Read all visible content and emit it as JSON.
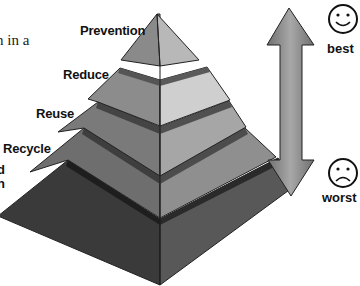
{
  "text_fragments": {
    "left_top": "n in a",
    "left_mid_1": "d",
    "left_mid_2": "n"
  },
  "pyramid": {
    "levels": [
      {
        "label": "Prevention",
        "left_color": "#8a8a8a",
        "right_color": "#b8b8b8"
      },
      {
        "label": "Reduce",
        "left_color": "#8c8c8c",
        "right_color": "#cfcfcf"
      },
      {
        "label": "Reuse",
        "left_color": "#7a7a7a",
        "right_color": "#a6a6a6"
      },
      {
        "label": "Recycle",
        "left_color": "#6e6e6e",
        "right_color": "#8f8f8f"
      },
      {
        "label": "",
        "left_color": "#3a3a3a",
        "right_color": "#555555"
      }
    ],
    "separator_color": "#4a4a4a"
  },
  "scale": {
    "top_label": "best",
    "bottom_label": "worst",
    "top_face": "smiley-face",
    "bottom_face": "sad-face",
    "arrow_color": "#8e8e8e"
  }
}
